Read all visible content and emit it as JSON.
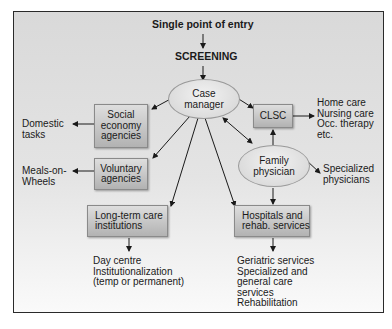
{
  "header": {
    "entry": "Single point of entry",
    "screening": "SCREENING"
  },
  "nodes": {
    "case_manager": "Case\nmanager",
    "social_economy": "Social\neconomy\nagencies",
    "voluntary": "Voluntary\nagencies",
    "clsc": "CLSC",
    "family_physician": "Family\nphysician",
    "long_term_care": "Long-term care\ninstitutions",
    "hospitals": "Hospitals and\nrehab. services"
  },
  "outputs": {
    "domestic": "Domestic\ntasks",
    "meals": "Meals-on-\nWheels",
    "clsc_services": "Home care\nNursing care\nOcc. therapy\netc.",
    "specialized": "Specialized\nphysicians",
    "ltc_services": "Day centre\nInstitutionalization\n(temp or permanent)",
    "hospital_services": "Geriatric services\nSpecialized and\ngeneral care\nservices\nRehabilitation"
  },
  "colors": {
    "frame_border": "#2a2a2a",
    "box_fill_top": "#dedede",
    "box_fill_bottom": "#b2b2b2",
    "ellipse_fill": "#e6e6e6",
    "arrow": "#1a1a1a"
  }
}
